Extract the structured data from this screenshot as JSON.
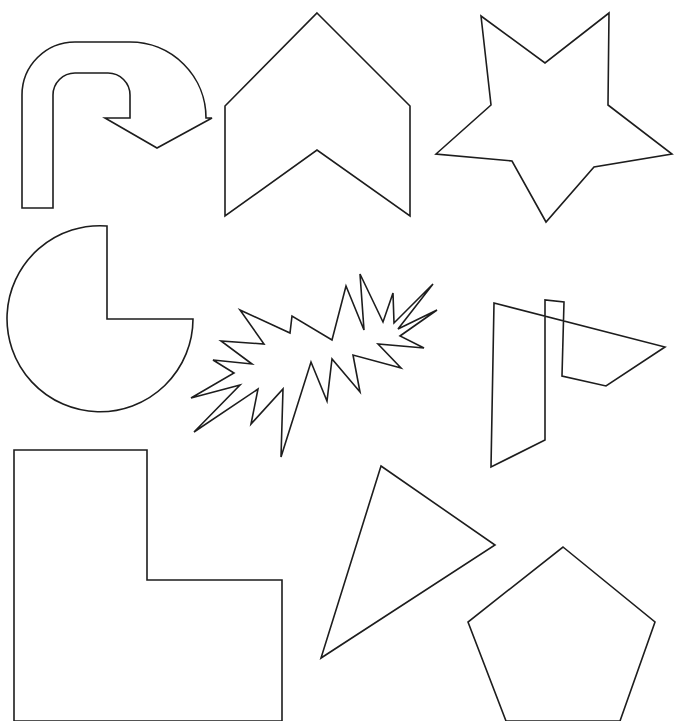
{
  "canvas": {
    "width": 674,
    "height": 721,
    "background_color": "#ffffff",
    "stroke_color": "#1d1d1d",
    "fill_color": "#ffffff",
    "stroke_width": 1.6,
    "description": "Grid of nine black-outline geometric shape drawings on a white background"
  },
  "shapes": [
    {
      "id": "u-turn-arrow",
      "name": "U-turn arrow",
      "row": 1,
      "column": 1,
      "bbox": [
        18,
        14,
        212,
        210
      ],
      "path": "M 22 208 L 22 95 A 53 53 0 0 1 75 42 L 130 42 A 76 76 0 0 1 206 118 L 206 118 L 212 118 L 157 148 L 105 118 L 130 118 L 130 95 A 22 22 0 0 0 108 73 L 75 73 A 22 22 0 0 0 53 95 L 53 208 Z"
    },
    {
      "id": "chevron-up-block",
      "name": "Up chevron block arrow",
      "row": 1,
      "column": 2,
      "bbox": [
        225,
        13,
        410,
        216
      ],
      "path": "M 317 13 L 410 106 L 410 216 L 317 150 L 225 216 L 225 106 Z"
    },
    {
      "id": "five-point-star",
      "name": "Five pointed star",
      "row": 1,
      "column": 3,
      "bbox": [
        434,
        13,
        674,
        225
      ],
      "path": "M 481 16 L 545 63 L 609 13 L 608 105 L 672 154 L 594 167 L 546 222 L 512 161 L 436 154 L 491 105 Z"
    },
    {
      "id": "pac-man-pie",
      "name": "Pac-Man pie circle with quarter removed",
      "row": 2,
      "column": 1,
      "bbox": [
        13,
        226,
        193,
        412
      ],
      "path": "M 107 319 L 107 226 A 93 93 0 1 0 193 319 Z"
    },
    {
      "id": "explosion-burst",
      "name": "Explosion starburst",
      "row": 2,
      "column": 2,
      "bbox": [
        191,
        272,
        437,
        457
      ],
      "path": "M 240 310 L 290 333 L 292 316 L 332 340 L 346 286 L 364 330 L 360 274 L 383 322 L 393 293 L 394 323 L 433 284 L 398 329 L 437 310 L 400 336 L 424 348 L 378 344 L 401 368 L 353 355 L 360 392 L 332 359 L 327 401 L 311 362 L 281 457 L 283 389 L 251 424 L 258 389 L 194 432 L 240 385 L 191 398 L 234 373 L 213 360 L 252 364 L 221 341 L 264 344 Z"
    },
    {
      "id": "right-block-arrow",
      "name": "Right pointing bent block arrow",
      "row": 2,
      "column": 3,
      "bbox": [
        491,
        302,
        665,
        467
      ],
      "path": "M 494 303 L 665 347 L 606 386 L 562 376 L 564 302 L 545 300 L 545 440 L 491 467 Z"
    },
    {
      "id": "l-shape",
      "name": "L-shaped polygon",
      "row": 3,
      "column": 1,
      "bbox": [
        14,
        450,
        282,
        721
      ],
      "path": "M 14 450 L 147 450 L 147 580 L 282 580 L 282 721 L 14 721 Z"
    },
    {
      "id": "rotated-triangle",
      "name": "Rotated triangle",
      "row": 3,
      "column": 2,
      "bbox": [
        321,
        466,
        495,
        660
      ],
      "path": "M 381 466 L 495 545 L 321 658 Z"
    },
    {
      "id": "pentagon",
      "name": "Regular pentagon",
      "row": 3,
      "column": 3,
      "bbox": [
        468,
        547,
        655,
        721
      ],
      "path": "M 563 547 L 655 622 L 620 721 L 506 721 L 468 622 Z"
    }
  ]
}
